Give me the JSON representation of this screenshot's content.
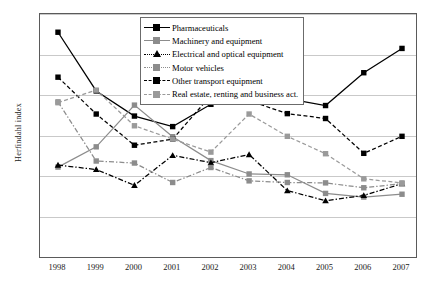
{
  "chart_data": {
    "type": "line",
    "title": "",
    "xlabel": "",
    "ylabel": "Herfindahl index",
    "categories": [
      "1998",
      "1999",
      "2000",
      "2001",
      "2002",
      "2003",
      "2004",
      "2005",
      "2006",
      "2007"
    ],
    "x": [
      1998,
      1999,
      2000,
      2001,
      2002,
      2003,
      2004,
      2005,
      2006,
      2007
    ],
    "ylim": [
      0.0,
      0.6
    ],
    "yticks": [
      "0.0",
      "0.1",
      "0.2",
      "0.3",
      "0.4",
      "0.5",
      "0.6"
    ],
    "ytick_values": [
      0.0,
      0.1,
      0.2,
      0.3,
      0.4,
      0.5,
      0.6
    ],
    "grid": true,
    "legend_position": "top-center",
    "series": [
      {
        "name": "Pharmaceuticals",
        "color": "#000000",
        "line_style": "solid",
        "marker": "square",
        "values": [
          0.555,
          0.41,
          0.348,
          0.322,
          0.377,
          0.395,
          0.391,
          0.374,
          0.455,
          0.515
        ]
      },
      {
        "name": "Machinery and equipment",
        "color": "#8c8c8c",
        "line_style": "solid",
        "marker": "square",
        "values": [
          0.222,
          0.272,
          0.375,
          0.297,
          0.238,
          0.205,
          0.203,
          0.157,
          0.148,
          0.155
        ]
      },
      {
        "name": "Electrical and optical equipment",
        "color": "#000000",
        "line_style": "dashdot",
        "marker": "triangle",
        "values": [
          0.227,
          0.216,
          0.177,
          0.251,
          0.233,
          0.253,
          0.164,
          0.139,
          0.152,
          0.181
        ]
      },
      {
        "name": "Motor vehicles",
        "color": "#8c8c8c",
        "line_style": "dashdot",
        "marker": "square",
        "values": [
          0.383,
          0.237,
          0.232,
          0.184,
          0.221,
          0.188,
          0.184,
          0.183,
          0.171,
          0.181
        ]
      },
      {
        "name": "Other transport equipment",
        "color": "#000000",
        "line_style": "dashed",
        "marker": "square",
        "values": [
          0.444,
          0.353,
          0.276,
          0.291,
          0.399,
          0.386,
          0.354,
          0.342,
          0.256,
          0.298
        ]
      },
      {
        "name": "Real estate, renting and business act.",
        "color": "#9a9a9a",
        "line_style": "dashed",
        "marker": "square",
        "values": [
          0.381,
          0.412,
          0.324,
          0.291,
          0.259,
          0.353,
          0.298,
          0.255,
          0.193,
          0.183
        ]
      }
    ]
  }
}
